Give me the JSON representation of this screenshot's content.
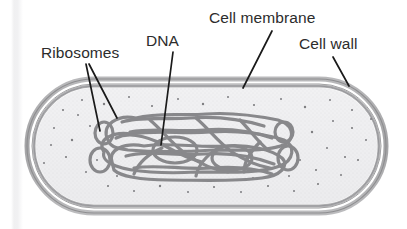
{
  "figure": {
    "background_color": "#ffffff",
    "label_color": "#2c2c2c",
    "leader_line_color": "#1a1a1a"
  },
  "labels": [
    {
      "id": "ribosomes",
      "text": "Ribosomes",
      "points_to": "ribosome-dots",
      "leaders": 2
    },
    {
      "id": "dna",
      "text": "DNA",
      "points_to": "nucleoid",
      "leaders": 1
    },
    {
      "id": "cell_membrane",
      "text": "Cell membrane",
      "points_to": "inner-membrane-layer",
      "leaders": 1
    },
    {
      "id": "cell_wall",
      "text": "Cell wall",
      "points_to": "outer-wall-layer",
      "leaders": 1
    }
  ],
  "cell": {
    "shape": "capsule",
    "cell_wall_color": "#9a9a9c",
    "cell_membrane_color": "#b3b3b5",
    "cytoplasm_color": "#eeeef0",
    "nucleoid_color": "#8b8b8d",
    "ribosome_dot_color": "#7d7d80",
    "ribosome_dot_count": 46
  }
}
